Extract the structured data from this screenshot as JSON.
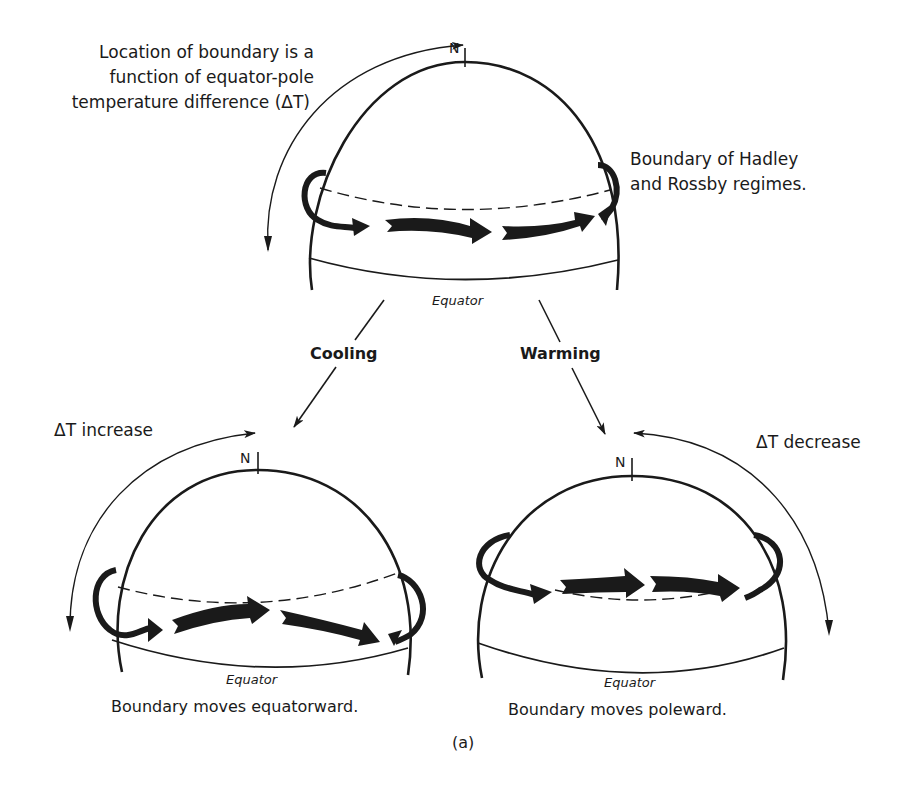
{
  "figure": {
    "label": "(a)",
    "top_note": {
      "lines": [
        "Location of boundary is a",
        "function of equator-pole",
        "temperature difference (ΔT)"
      ]
    },
    "boundary_note": {
      "lines": [
        "Boundary of Hadley",
        "and Rossby regimes."
      ]
    },
    "top_globe": {
      "pole_label": "N",
      "equator_label": "Equator"
    },
    "transitions": {
      "cooling_label": "Cooling",
      "warming_label": "Warming"
    },
    "left_globe": {
      "pole_label": "N",
      "equator_label": "Equator",
      "delta_label": "ΔT increase",
      "caption": "Boundary moves equatorward."
    },
    "right_globe": {
      "pole_label": "N",
      "equator_label": "Equator",
      "delta_label": "ΔT decrease",
      "caption": "Boundary moves poleward."
    },
    "colors": {
      "ink": "#1a1a1a",
      "background": "#ffffff"
    }
  }
}
